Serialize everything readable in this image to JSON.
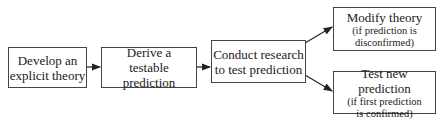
{
  "diagram": {
    "type": "flowchart",
    "nodes": [
      {
        "id": "develop",
        "lines": [
          "Develop an",
          "explicit theory"
        ]
      },
      {
        "id": "derive",
        "lines": [
          "Derive a",
          "testable prediction"
        ]
      },
      {
        "id": "conduct",
        "lines": [
          "Conduct research",
          "to test prediction"
        ]
      },
      {
        "id": "modify",
        "title": "Modify theory",
        "note_lines": [
          "(if prediction is",
          "disconfirmed)"
        ]
      },
      {
        "id": "testnew",
        "title": "Test new prediction",
        "note_lines": [
          "(if first prediction",
          "is confirmed)"
        ]
      }
    ],
    "edges": [
      {
        "from": "develop",
        "to": "derive"
      },
      {
        "from": "derive",
        "to": "conduct"
      },
      {
        "from": "conduct",
        "to": "modify"
      },
      {
        "from": "conduct",
        "to": "testnew"
      }
    ],
    "colors": {
      "stroke": "#444444",
      "text": "#1a1a1a",
      "background": "#ffffff"
    }
  }
}
